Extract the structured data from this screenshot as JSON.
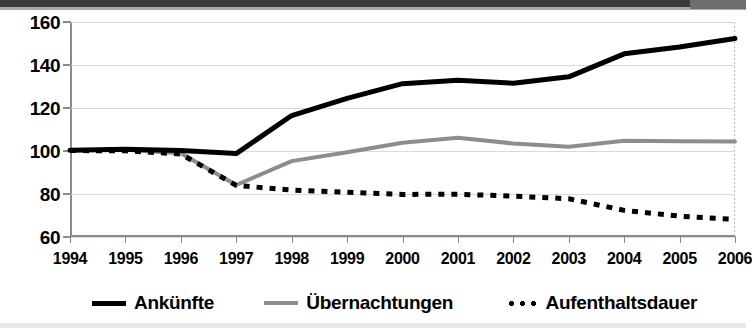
{
  "chart_data": {
    "type": "line",
    "title": "",
    "subtitle": "",
    "xlabel": "",
    "ylabel": "",
    "x": [
      1994,
      1995,
      1996,
      1997,
      1998,
      1999,
      2000,
      2001,
      2002,
      2003,
      2004,
      2005,
      2006
    ],
    "categories": [
      "1994",
      "1995",
      "1996",
      "1997",
      "1998",
      "1999",
      "2000",
      "2001",
      "2002",
      "2003",
      "2004",
      "2005",
      "2006"
    ],
    "ylim": [
      60,
      160
    ],
    "yticks": [
      60,
      80,
      100,
      120,
      140,
      160
    ],
    "ytick_labels": [
      "60",
      "80",
      "100",
      "120",
      "140",
      "160"
    ],
    "grid": true,
    "legend_position": "bottom",
    "series": [
      {
        "name": "Ankünfte",
        "style": "solid",
        "color": "#000000",
        "width": 5,
        "values": [
          100.3,
          100.8,
          100.2,
          98.8,
          116.5,
          124.5,
          131.3,
          132.9,
          131.5,
          134.5,
          145.2,
          148.4,
          152.3
        ]
      },
      {
        "name": "Übernachtungen",
        "style": "solid",
        "color": "#8d8d8d",
        "width": 4,
        "values": [
          100.3,
          100.6,
          99.0,
          84.2,
          95.3,
          99.4,
          103.8,
          106.2,
          103.5,
          102.0,
          104.8,
          104.5,
          104.4
        ]
      },
      {
        "name": "Aufenthaltsdauer",
        "style": "dotted",
        "color": "#000000",
        "width": 5,
        "values": [
          100.2,
          100.1,
          98.6,
          84.0,
          81.8,
          80.8,
          79.8,
          79.9,
          79.0,
          77.8,
          72.4,
          69.7,
          68.2
        ]
      }
    ]
  },
  "axes": {
    "y_tick_labels": [
      "160",
      "140",
      "120",
      "100",
      "80",
      "60"
    ],
    "x_tick_labels": [
      "1994",
      "1995",
      "1996",
      "1997",
      "1998",
      "1999",
      "2000",
      "2001",
      "2002",
      "2003",
      "2004",
      "2005",
      "2006"
    ]
  },
  "legend": {
    "items": [
      {
        "label": "Ankünfte",
        "swatch": "solid-black-line"
      },
      {
        "label": "Übernachtungen",
        "swatch": "solid-gray-line"
      },
      {
        "label": "Aufenthaltsdauer",
        "swatch": "dotted-black-line"
      }
    ]
  },
  "colors": {
    "ankuenfte": "#000000",
    "uebernachtungen": "#8d8d8d",
    "aufenthaltsdauer": "#000000",
    "grid": "#d9d9d9",
    "axis": "#8a8a8a",
    "background": "#ffffff"
  }
}
